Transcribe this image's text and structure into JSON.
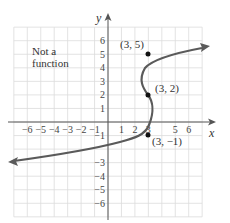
{
  "chart_data": {
    "type": "line",
    "title": "",
    "xlabel": "x",
    "ylabel": "y",
    "xlim": [
      -7,
      7
    ],
    "ylim": [
      -7,
      7
    ],
    "grid": true,
    "x_ticks": [
      "−6",
      "−5",
      "−4",
      "−3",
      "−2",
      "−1",
      "1",
      "2",
      "3",
      "5",
      "6"
    ],
    "x_tick_values": [
      -6,
      -5,
      -4,
      -3,
      -2,
      -1,
      1,
      2,
      3,
      5,
      6
    ],
    "y_ticks": [
      "6",
      "5",
      "4",
      "3",
      "2",
      "1",
      "−1",
      "−3",
      "−4",
      "−5",
      "−6"
    ],
    "y_tick_values": [
      6,
      5,
      4,
      3,
      2,
      1,
      -1,
      -3,
      -4,
      -5,
      -6
    ],
    "annotation": [
      "Not a",
      "function"
    ],
    "series": [
      {
        "name": "curve",
        "description": "Sideways parabola-like curve, x as function of y; arrows on both ends",
        "points": [
          [
            -7,
            -2.9
          ],
          [
            -3,
            -2.3
          ],
          [
            0,
            -1.7
          ],
          [
            3,
            -1
          ],
          [
            3.8,
            0
          ],
          [
            3.9,
            1
          ],
          [
            3,
            2
          ],
          [
            2.5,
            3.2
          ],
          [
            2.5,
            4
          ],
          [
            3,
            5
          ],
          [
            5,
            5.9
          ],
          [
            6.8,
            6.3
          ]
        ]
      }
    ],
    "labeled_points": [
      {
        "label": "(3, 5)",
        "x": 3,
        "y": 5
      },
      {
        "label": "(3, 2)",
        "x": 3,
        "y": 2
      },
      {
        "label": "(3, −1)",
        "x": 3,
        "y": -1
      }
    ],
    "colors": {
      "curve": "#5a5a5a",
      "grid": "#dcdcdc",
      "axis": "#555555",
      "point": "#111111"
    }
  }
}
